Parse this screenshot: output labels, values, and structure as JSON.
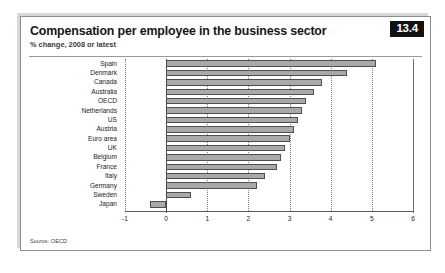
{
  "figure": {
    "title": "Compensation per employee in the business sector",
    "subtitle": "% change, 2008 or latest",
    "badge": "13.4",
    "source": "Source: OECD"
  },
  "colors": {
    "bar_fill": "#a9a9a9",
    "bar_stroke": "#4f4f4f",
    "badge_bg": "#111111",
    "badge_text": "#ffffff",
    "frame": "#8d8d8d",
    "grid": "#7d7d7d",
    "axis": "#4a4a4a"
  },
  "chart_data": {
    "type": "bar",
    "orientation": "horizontal",
    "title": "Compensation per employee in the business sector",
    "subtitle": "% change, 2008 or latest",
    "xlabel": "",
    "ylabel": "",
    "xlim": [
      -1,
      6
    ],
    "xticks": [
      -1,
      0,
      1,
      2,
      3,
      4,
      5,
      6
    ],
    "xtick_labels": [
      "-1",
      "0",
      "1",
      "2",
      "3",
      "4",
      "5",
      "6"
    ],
    "grid": true,
    "legend": null,
    "source": "Source: OECD",
    "categories": [
      "Spain",
      "Denmark",
      "Canada",
      "Australia",
      "OECD",
      "Netherlands",
      "US",
      "Austria",
      "Euro area",
      "UK",
      "Belgium",
      "France",
      "Italy",
      "Germany",
      "Sweden",
      "Japan"
    ],
    "values": [
      5.1,
      4.4,
      3.8,
      3.6,
      3.4,
      3.3,
      3.2,
      3.1,
      3.0,
      2.9,
      2.8,
      2.7,
      2.4,
      2.2,
      0.6,
      -0.4
    ]
  }
}
